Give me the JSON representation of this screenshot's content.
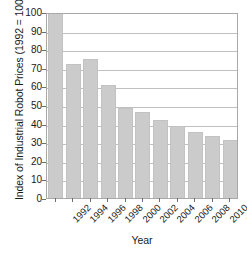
{
  "chart_data": {
    "type": "bar",
    "title": "",
    "subtitle": "",
    "xlabel": "Year",
    "ylabel": "Index of Industrial Robot Prices (1992 = 100)",
    "categories": [
      "1992",
      "1994",
      "1996",
      "1998",
      "2000",
      "2002",
      "2004",
      "2006",
      "2008",
      "2010",
      "2012"
    ],
    "values": [
      100,
      72,
      75,
      60.5,
      48.5,
      46.5,
      42,
      38.5,
      35.5,
      33.5,
      31
    ],
    "series": [
      {
        "name": "Index of Industrial Robot Prices",
        "values": [
          100,
          72,
          75,
          60.5,
          48.5,
          46.5,
          42,
          38.5,
          35.5,
          33.5,
          31
        ]
      }
    ],
    "ylim": [
      0,
      100
    ],
    "y_ticks": [
      0,
      10,
      20,
      30,
      40,
      50,
      60,
      70,
      80,
      90,
      100
    ],
    "y_tick_labels": [
      "0",
      "10",
      "20",
      "30",
      "40",
      "50",
      "60",
      "70",
      "80",
      "90",
      "100"
    ],
    "x_tick_labels": [
      "1992",
      "1994",
      "1996",
      "1998",
      "2000",
      "2002",
      "2004",
      "2006",
      "2008",
      "2010",
      "2012"
    ],
    "x_tick_label_rotation": -45,
    "grid": true,
    "grid_axis": "y",
    "legend": false,
    "legend_position": "none",
    "bar_color": "#cbcbcb",
    "bar_edge_color": "#c2c2c2",
    "grid_color": "#c0c0c0",
    "axis_color": "#a8a8a8",
    "background_color": "#ffffff",
    "text_color": "#1a1a1a"
  }
}
